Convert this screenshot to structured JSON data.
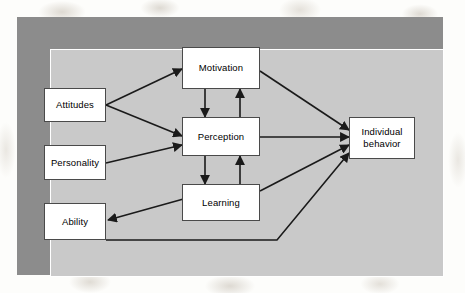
{
  "figure": {
    "frame_color": "#8c8c8c",
    "canvas_color": "#c9c9c9",
    "box_fill": "#ffffff",
    "box_border": "#4a4a4a",
    "arrow_color": "#1a1a1a"
  },
  "nodes": [
    {
      "id": "attitudes",
      "label": "Attitudes"
    },
    {
      "id": "personality",
      "label": "Personality"
    },
    {
      "id": "ability",
      "label": "Ability"
    },
    {
      "id": "motivation",
      "label": "Motivation"
    },
    {
      "id": "perception",
      "label": "Perception"
    },
    {
      "id": "learning",
      "label": "Learning"
    },
    {
      "id": "individual_behavior",
      "label": "Individual\nbehavior"
    }
  ],
  "edges": [
    {
      "from": "attitudes",
      "to": "motivation"
    },
    {
      "from": "attitudes",
      "to": "perception"
    },
    {
      "from": "personality",
      "to": "perception"
    },
    {
      "from": "motivation",
      "to": "perception"
    },
    {
      "from": "perception",
      "to": "motivation"
    },
    {
      "from": "perception",
      "to": "learning"
    },
    {
      "from": "learning",
      "to": "perception"
    },
    {
      "from": "learning",
      "to": "ability"
    },
    {
      "from": "motivation",
      "to": "individual_behavior"
    },
    {
      "from": "perception",
      "to": "individual_behavior"
    },
    {
      "from": "learning",
      "to": "individual_behavior"
    },
    {
      "from": "ability",
      "to": "individual_behavior"
    }
  ]
}
